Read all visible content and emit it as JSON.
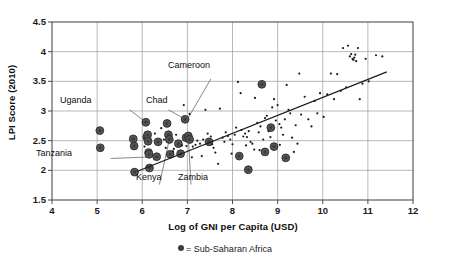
{
  "chart_data": {
    "type": "scatter",
    "title": "",
    "xlabel": "Log of GNI per Capita (USD)",
    "ylabel": "LPI Score (2010)",
    "xlim": [
      4,
      12
    ],
    "ylim": [
      1.5,
      4.5
    ],
    "xticks": [
      "4",
      "5",
      "6",
      "7",
      "8",
      "9",
      "10",
      "11",
      "12"
    ],
    "yticks": [
      "1.5",
      "2",
      "2.5",
      "3",
      "3.5",
      "4",
      "4.5"
    ],
    "grid": true,
    "legend_position": "bottom-center",
    "legend": [
      {
        "marker": "filled-circle",
        "label": "= Sub-Saharan Africa"
      }
    ],
    "trendline": {
      "type": "linear",
      "x0": 5.88,
      "y0": 1.98,
      "x1": 11.42,
      "y1": 3.66,
      "color": "#1a1a1a"
    },
    "series": [
      {
        "name": "Sub-Saharan Africa",
        "marker": "large-filled-circle",
        "color": "#555555",
        "points": [
          [
            5.06,
            2.67
          ],
          [
            5.07,
            2.38
          ],
          [
            5.8,
            2.53
          ],
          [
            5.82,
            2.41
          ],
          [
            5.83,
            1.97
          ],
          [
            6.08,
            2.81
          ],
          [
            6.1,
            2.56
          ],
          [
            6.12,
            2.6
          ],
          [
            6.13,
            2.49
          ],
          [
            6.14,
            2.3
          ],
          [
            6.15,
            2.27
          ],
          [
            6.16,
            2.04
          ],
          [
            6.32,
            2.23
          ],
          [
            6.35,
            2.48
          ],
          [
            6.55,
            2.79
          ],
          [
            6.58,
            2.6
          ],
          [
            6.6,
            2.52
          ],
          [
            6.62,
            2.27
          ],
          [
            6.8,
            2.45
          ],
          [
            6.85,
            2.28
          ],
          [
            6.95,
            2.86
          ],
          [
            6.97,
            2.55
          ],
          [
            7.02,
            2.58
          ],
          [
            7.05,
            2.52
          ],
          [
            7.48,
            2.48
          ],
          [
            8.15,
            2.24
          ],
          [
            8.35,
            2.01
          ],
          [
            8.65,
            3.45
          ],
          [
            8.72,
            2.31
          ],
          [
            8.85,
            2.72
          ],
          [
            8.92,
            2.4
          ],
          [
            9.18,
            2.21
          ]
        ]
      },
      {
        "name": "Other countries",
        "marker": "small-dot",
        "color": "#1a1a1a",
        "points": [
          [
            6.42,
            2.71
          ],
          [
            6.52,
            2.38
          ],
          [
            6.68,
            2.32
          ],
          [
            6.75,
            2.6
          ],
          [
            6.88,
            2.42
          ],
          [
            6.92,
            3.1
          ],
          [
            6.98,
            2.41
          ],
          [
            7.05,
            2.95
          ],
          [
            7.12,
            2.4
          ],
          [
            7.18,
            2.43
          ],
          [
            7.22,
            2.5
          ],
          [
            7.28,
            2.45
          ],
          [
            7.32,
            2.24
          ],
          [
            7.4,
            3.02
          ],
          [
            7.45,
            2.62
          ],
          [
            7.52,
            2.57
          ],
          [
            7.58,
            2.38
          ],
          [
            7.62,
            2.3
          ],
          [
            7.68,
            2.11
          ],
          [
            7.72,
            3.04
          ],
          [
            7.78,
            2.55
          ],
          [
            7.82,
            2.48
          ],
          [
            7.85,
            2.64
          ],
          [
            7.9,
            2.58
          ],
          [
            7.95,
            2.52
          ],
          [
            8.0,
            2.44
          ],
          [
            8.05,
            2.6
          ],
          [
            8.08,
            2.72
          ],
          [
            8.12,
            3.49
          ],
          [
            8.18,
            3.3
          ],
          [
            8.2,
            2.68
          ],
          [
            8.24,
            2.57
          ],
          [
            8.28,
            2.62
          ],
          [
            8.32,
            2.56
          ],
          [
            8.36,
            2.66
          ],
          [
            8.4,
            2.48
          ],
          [
            8.44,
            2.45
          ],
          [
            8.48,
            2.35
          ],
          [
            8.5,
            3.22
          ],
          [
            8.55,
            2.8
          ],
          [
            8.58,
            2.64
          ],
          [
            8.62,
            2.74
          ],
          [
            8.68,
            2.52
          ],
          [
            8.72,
            2.88
          ],
          [
            8.76,
            2.92
          ],
          [
            8.8,
            2.66
          ],
          [
            8.84,
            2.56
          ],
          [
            8.88,
            3.06
          ],
          [
            8.92,
            3.2
          ],
          [
            8.96,
            2.84
          ],
          [
            9.0,
            3.1
          ],
          [
            9.04,
            2.78
          ],
          [
            9.08,
            2.72
          ],
          [
            9.12,
            2.6
          ],
          [
            9.16,
            2.86
          ],
          [
            9.2,
            3.44
          ],
          [
            9.24,
            3.02
          ],
          [
            9.28,
            2.96
          ],
          [
            9.32,
            2.55
          ],
          [
            9.36,
            2.31
          ],
          [
            9.4,
            2.76
          ],
          [
            9.48,
            3.63
          ],
          [
            9.52,
            2.94
          ],
          [
            9.6,
            3.24
          ],
          [
            9.68,
            2.86
          ],
          [
            9.75,
            2.74
          ],
          [
            9.82,
            3.17
          ],
          [
            9.88,
            2.96
          ],
          [
            9.94,
            3.3
          ],
          [
            10.02,
            2.9
          ],
          [
            10.1,
            3.28
          ],
          [
            10.18,
            3.63
          ],
          [
            10.25,
            3.2
          ],
          [
            10.32,
            3.62
          ],
          [
            10.4,
            3.34
          ],
          [
            10.45,
            4.06
          ],
          [
            10.52,
            3.4
          ],
          [
            10.56,
            4.1
          ],
          [
            10.6,
            3.92
          ],
          [
            10.63,
            3.96
          ],
          [
            10.66,
            3.88
          ],
          [
            10.68,
            3.86
          ],
          [
            10.7,
            3.9
          ],
          [
            10.72,
            3.95
          ],
          [
            10.74,
            3.84
          ],
          [
            10.78,
            4.06
          ],
          [
            10.82,
            3.2
          ],
          [
            10.88,
            3.46
          ],
          [
            10.95,
            3.88
          ],
          [
            11.02,
            3.5
          ],
          [
            11.18,
            3.94
          ],
          [
            11.32,
            3.92
          ],
          [
            6.05,
            2.4
          ],
          [
            6.28,
            2.62
          ],
          [
            6.48,
            2.52
          ],
          [
            6.7,
            2.36
          ],
          [
            7.1,
            2.22
          ],
          [
            7.35,
            2.52
          ],
          [
            7.55,
            2.44
          ],
          [
            7.98,
            2.28
          ],
          [
            8.3,
            2.42
          ],
          [
            8.6,
            2.34
          ],
          [
            9.05,
            2.43
          ],
          [
            9.44,
            2.45
          ]
        ]
      }
    ],
    "annotations": [
      {
        "label": "Cameroon",
        "x": 7.0,
        "y": 2.86
      },
      {
        "label": "Uganda",
        "x": 6.08,
        "y": 2.81
      },
      {
        "label": "Chad",
        "x": 6.95,
        "y": 2.86
      },
      {
        "label": "Tanzania",
        "x": 6.32,
        "y": 2.23
      },
      {
        "label": "Kenya",
        "x": 6.6,
        "y": 2.52
      },
      {
        "label": "Zambia",
        "x": 7.02,
        "y": 2.58
      }
    ]
  },
  "labels": {
    "ylabel": "LPI Score (2010)",
    "xlabel": "Log of GNI per Capita (USD)",
    "legend_text": "= Sub-Saharan Africa",
    "annot_cameroon": "Cameroon",
    "annot_uganda": "Uganda",
    "annot_chad": "Chad",
    "annot_tanzania": "Tanzania",
    "annot_kenya": "Kenya",
    "annot_zambia": "Zambia"
  },
  "colors": {
    "frame": "#4d4d4d",
    "grid": "#9a9a9a",
    "marker_large": "#555555",
    "marker_small": "#1a1a1a",
    "trend": "#1a1a1a",
    "text": "#0d0d0d",
    "background": "#ffffff"
  }
}
